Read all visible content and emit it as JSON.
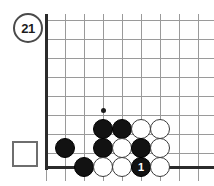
{
  "diagram": {
    "badge_label": "21",
    "badge_name": "diagram-number-21",
    "prisoner_box_label": "",
    "board_colors": {
      "grid": "#9a9a9a",
      "edge": "#2b2b2b",
      "black_stone": "#121212",
      "white_stone": "#ffffff",
      "background": "#ffffff"
    },
    "geometry": {
      "cell": 19,
      "origin_x": 46,
      "origin_y": 20,
      "left_edge_x": 46,
      "bottom_edge_y": 167,
      "star_point": {
        "x": 103,
        "y": 110
      }
    },
    "grid": {
      "vertical_x": [
        46,
        65,
        84,
        103,
        122,
        141,
        160,
        179,
        198
      ],
      "horizontal_y": [
        20,
        39,
        58,
        77,
        96,
        115,
        134,
        153,
        167
      ]
    },
    "stones": [
      {
        "name": "stone-black-c4",
        "color": "black",
        "x": 103,
        "y": 129,
        "label": ""
      },
      {
        "name": "stone-black-d4",
        "color": "black",
        "x": 122,
        "y": 129,
        "label": ""
      },
      {
        "name": "stone-white-e4",
        "color": "white",
        "x": 141,
        "y": 129,
        "label": ""
      },
      {
        "name": "stone-white-f4",
        "color": "white",
        "x": 160,
        "y": 129,
        "label": ""
      },
      {
        "name": "stone-black-a3",
        "color": "black",
        "x": 65,
        "y": 148,
        "label": ""
      },
      {
        "name": "stone-black-c3",
        "color": "black",
        "x": 103,
        "y": 148,
        "label": ""
      },
      {
        "name": "stone-white-d3",
        "color": "white",
        "x": 122,
        "y": 148,
        "label": ""
      },
      {
        "name": "stone-black-e3",
        "color": "black",
        "x": 141,
        "y": 148,
        "label": ""
      },
      {
        "name": "stone-white-f3",
        "color": "white",
        "x": 160,
        "y": 148,
        "label": ""
      },
      {
        "name": "stone-black-b2",
        "color": "black",
        "x": 84,
        "y": 167,
        "label": ""
      },
      {
        "name": "stone-white-c2",
        "color": "white",
        "x": 103,
        "y": 167,
        "label": ""
      },
      {
        "name": "stone-white-d2",
        "color": "white",
        "x": 122,
        "y": 167,
        "label": ""
      },
      {
        "name": "stone-black-move-1",
        "color": "black",
        "x": 141,
        "y": 167,
        "label": "1"
      },
      {
        "name": "stone-white-f2",
        "color": "white",
        "x": 160,
        "y": 167,
        "label": ""
      }
    ]
  }
}
